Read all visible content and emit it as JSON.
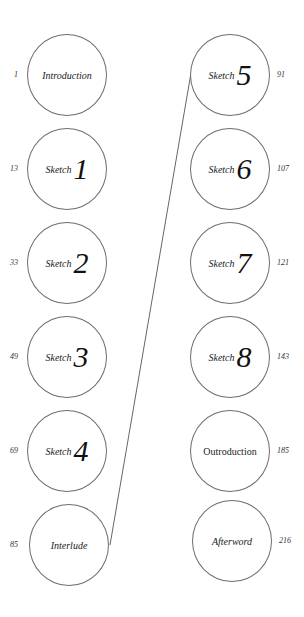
{
  "diagram": {
    "title": "",
    "connector": {
      "from": "Sketch 5",
      "to": "Interlude",
      "x1": 191,
      "y1": 73,
      "x2": 110,
      "y2": 545,
      "color": "#555555"
    },
    "left_column": [
      {
        "label": "Introduction",
        "type": "text",
        "page": "1"
      },
      {
        "label": "Sketch",
        "numeral": "1",
        "type": "sketch",
        "page": "13"
      },
      {
        "label": "Sketch",
        "numeral": "2",
        "type": "sketch",
        "page": "33"
      },
      {
        "label": "Sketch",
        "numeral": "3",
        "type": "sketch",
        "page": "49"
      },
      {
        "label": "Sketch",
        "numeral": "4",
        "type": "sketch",
        "page": "69"
      },
      {
        "label": "Interlude",
        "type": "text",
        "page": "85"
      }
    ],
    "right_column": [
      {
        "label": "Sketch",
        "numeral": "5",
        "type": "sketch",
        "page": "91"
      },
      {
        "label": "Sketch",
        "numeral": "6",
        "type": "sketch",
        "page": "107"
      },
      {
        "label": "Sketch",
        "numeral": "7",
        "type": "sketch",
        "page": "121"
      },
      {
        "label": "Sketch",
        "numeral": "8",
        "type": "sketch",
        "page": "143"
      },
      {
        "label": "Outroduction",
        "type": "text",
        "page": "185"
      },
      {
        "label": "Afterword",
        "type": "text",
        "page": "216"
      }
    ]
  }
}
